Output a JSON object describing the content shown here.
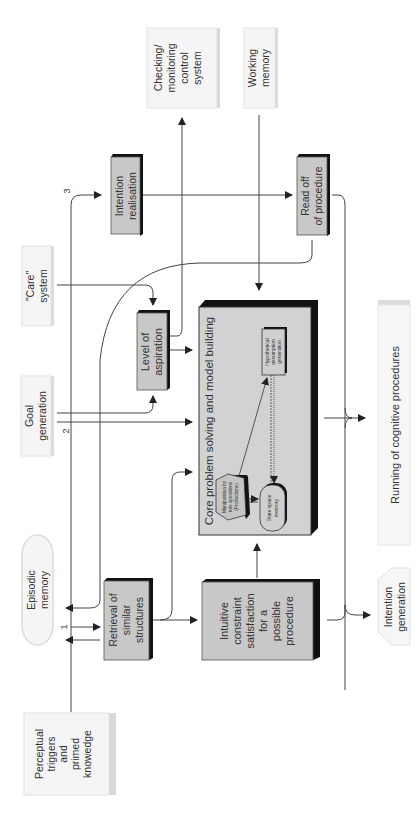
{
  "diagram": {
    "orientation": "rotated-90-ccw",
    "colors": {
      "process_box": "#c8c8c8",
      "core_box": "#d2d2d2",
      "shadow": "#111111",
      "external_box": "#f4f4f4",
      "external_shadow": "#d8d8d8",
      "line": "#444444",
      "text": "#333333"
    },
    "nodes": {
      "perceptual": {
        "lines": [
          "Perceptual",
          "triggers",
          "and",
          "primed",
          "knowedge"
        ]
      },
      "episodic": {
        "lines": [
          "Episodic",
          "memory"
        ]
      },
      "goal": {
        "lines": [
          "Goal",
          "generation"
        ]
      },
      "care": {
        "lines": [
          "\"Care\"",
          "system"
        ]
      },
      "checking": {
        "lines": [
          "Checking/",
          "monitoring",
          "control",
          "system"
        ]
      },
      "working": {
        "lines": [
          "Working",
          "memory"
        ]
      },
      "retrieval": {
        "lines": [
          "Retrieval of",
          "similar",
          "structures"
        ]
      },
      "intuitive": {
        "lines": [
          "Intuitive",
          "constraint",
          "satisfaction",
          "for a",
          "possible",
          "procedure"
        ]
      },
      "aspiration": {
        "lines": [
          "Level of",
          "aspiration"
        ]
      },
      "intention_realisation": {
        "lines": [
          "Intention",
          "realisation"
        ]
      },
      "read_off": {
        "lines": [
          "Read off",
          "of procedure"
        ]
      },
      "core": {
        "title": "Core problem solving and model building",
        "manipulation": {
          "lines": [
            "Manipulation by",
            "rule operations",
            "(Productions)"
          ]
        },
        "hypothetical": {
          "lines": [
            "Hypothetical",
            "assumption",
            "generation"
          ]
        },
        "state_space": {
          "lines": [
            "State space",
            "memory"
          ]
        }
      },
      "running": {
        "lines": [
          "Running of cognitive procedures"
        ]
      },
      "intention_generation": {
        "lines": [
          "Intention",
          "generation"
        ]
      }
    },
    "path_labels": {
      "one": "1",
      "two": "2",
      "three": "3"
    }
  }
}
